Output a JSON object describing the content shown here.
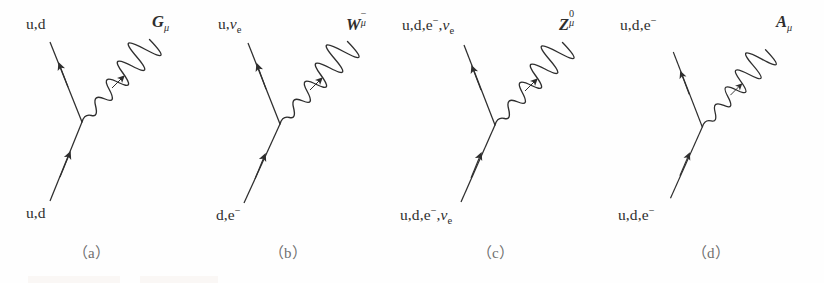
{
  "figure": {
    "background_color": "#fefefe",
    "ink_color": "#2e2e2e",
    "caption_color": "#6f6f6f"
  },
  "diagrams": [
    {
      "id": "gluon-vertex",
      "caption": "（a）",
      "incoming_label": "u,d",
      "outgoing_label": "u,d",
      "boson_symbol": "G",
      "boson_superscript": "",
      "boson_subscript": "μ",
      "boson_label_text": "Gμ"
    },
    {
      "id": "w-boson-vertex",
      "caption": "（b）",
      "incoming_label_prefix": "d,e",
      "incoming_label_sup": "−",
      "outgoing_label_prefix": "u,",
      "outgoing_label_nu": "ν",
      "outgoing_label_nu_sub": "e",
      "boson_symbol": "W",
      "boson_superscript": "−",
      "boson_subscript": "μ",
      "boson_label_text": "W⁻μ"
    },
    {
      "id": "z-boson-vertex",
      "caption": "（c）",
      "label_prefix": "u,d,e",
      "label_sup": "−",
      "label_mid": ",",
      "label_nu": "ν",
      "label_nu_sub": "e",
      "boson_symbol": "Z",
      "boson_superscript": "0",
      "boson_subscript": "μ",
      "boson_label_text": "Z0μ"
    },
    {
      "id": "photon-vertex",
      "caption": "（d）",
      "label_prefix": "u,d,e",
      "label_sup": "−",
      "boson_symbol": "A",
      "boson_superscript": "",
      "boson_subscript": "μ",
      "boson_label_text": "Aμ"
    }
  ]
}
